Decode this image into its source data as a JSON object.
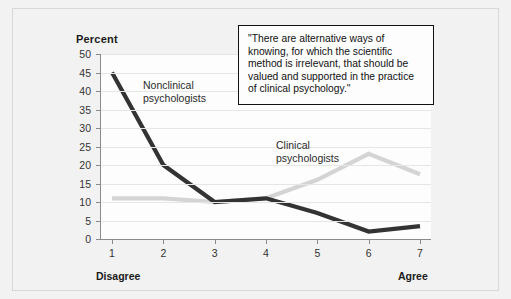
{
  "chart_data": {
    "type": "line",
    "title": "",
    "xlabel": "",
    "ylabel": "Percent",
    "ylim": [
      0,
      50
    ],
    "ytick_step": 5,
    "yticks": [
      0,
      5,
      10,
      15,
      20,
      25,
      30,
      35,
      40,
      45,
      50
    ],
    "categories": [
      "1",
      "2",
      "3",
      "4",
      "5",
      "6",
      "7"
    ],
    "xlim_anchor_low": "Disagree",
    "xlim_anchor_high": "Agree",
    "grid": true,
    "legend_position": "inline-annotation",
    "series": [
      {
        "name": "Nonclinical psychologists",
        "color": "#333333",
        "values": [
          45,
          20,
          10,
          11,
          7,
          2,
          3.5
        ]
      },
      {
        "name": "Clinical psychologists",
        "color": "#d4d4d4",
        "values": [
          11,
          11,
          10,
          11,
          16,
          23,
          17.5
        ]
      }
    ],
    "annotations": [
      {
        "name": "quote",
        "text": "\"There are alternative ways of knowing, for which the scientific method is irrelevant, that should be valued and supported in the practice of clinical psychology.\""
      }
    ]
  },
  "axis": {
    "y_title": "Percent",
    "y_labels": [
      "50",
      "45",
      "40",
      "35",
      "30",
      "25",
      "20",
      "15",
      "10",
      "5",
      "0"
    ],
    "x_labels": [
      "1",
      "2",
      "3",
      "4",
      "5",
      "6",
      "7"
    ],
    "anchor_low": "Disagree",
    "anchor_high": "Agree"
  },
  "labels": {
    "nonclinical": "Nonclinical\npsychologists",
    "clinical": "Clinical\npsychologists"
  },
  "quote": {
    "text": "\"There are alternative ways of knowing, for which the scientific method is irrelevant, that should be valued and supported in the practice of clinical psychology.\""
  },
  "colors": {
    "background": "#f2f2f2",
    "plot_background": "#fdfdfd",
    "axis": "#8a8a8a",
    "grid": "#e6e6e6",
    "series_dark": "#333333",
    "series_light": "#d4d4d4",
    "text": "#1a1a1a",
    "quote_border": "#111111"
  }
}
